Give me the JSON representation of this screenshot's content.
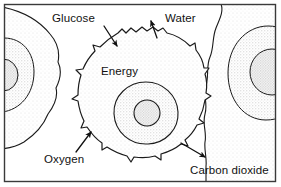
{
  "figure": {
    "frame": {
      "stroke_color": "#3a3a3a",
      "background_color": "#ffffff"
    },
    "palette": {
      "outline": "#1a1a1a",
      "stipple_light": "#f0f0f0",
      "stipple_mid": "#e2e2e2",
      "stipple_dark": "#cfcfcf",
      "text": "#111111"
    }
  },
  "labels": [
    {
      "id": "glucose",
      "text": "Glucose",
      "x": 52,
      "y": 22,
      "anchor": "start",
      "direction": "into-cell",
      "arrow": {
        "x1": 104,
        "y1": 26,
        "x2": 118,
        "y2": 47
      }
    },
    {
      "id": "water",
      "text": "Water",
      "x": 165,
      "y": 22,
      "anchor": "start",
      "direction": "out-of-cell",
      "arrow": {
        "x1": 157,
        "y1": 38,
        "x2": 150,
        "y2": 20
      }
    },
    {
      "id": "energy",
      "text": "Energy",
      "x": 101,
      "y": 75,
      "anchor": "start",
      "direction": "inside-cell",
      "arrow": null
    },
    {
      "id": "oxygen",
      "text": "Oxygen",
      "x": 44,
      "y": 163,
      "anchor": "start",
      "direction": "into-cell",
      "arrow": {
        "x1": 76,
        "y1": 152,
        "x2": 92,
        "y2": 131
      }
    },
    {
      "id": "carbon-dioxide",
      "text": "Carbon dioxide",
      "x": 190,
      "y": 174,
      "anchor": "start",
      "direction": "out-of-cell",
      "arrow": {
        "x1": 181,
        "y1": 143,
        "x2": 206,
        "y2": 158
      }
    }
  ],
  "cells": [
    {
      "id": "cell-left",
      "role": "neighbouring-cell",
      "cx": 14,
      "cy": 78,
      "has_nucleus": true
    },
    {
      "id": "cell-center",
      "role": "main-cell",
      "cx": 137,
      "cy": 95,
      "has_nucleus": true
    },
    {
      "id": "cell-right",
      "role": "neighbouring-cell",
      "cx": 266,
      "cy": 63,
      "has_nucleus": true
    }
  ]
}
